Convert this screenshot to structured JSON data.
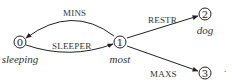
{
  "diagram": {
    "nodes": [
      {
        "id": "0",
        "label": "0",
        "word": "sleeping"
      },
      {
        "id": "1",
        "label": "1",
        "word": "most"
      },
      {
        "id": "2",
        "label": "2",
        "word": "dog"
      },
      {
        "id": "3",
        "label": "3",
        "word": ""
      }
    ],
    "edges": [
      {
        "from": "1",
        "to": "0",
        "label": "MINS"
      },
      {
        "from": "0",
        "to": "1",
        "label": "SLEEPER"
      },
      {
        "from": "1",
        "to": "2",
        "label": "RESTR"
      },
      {
        "from": "1",
        "to": "3",
        "label": "MAXS"
      }
    ],
    "trailing_mark": "."
  }
}
